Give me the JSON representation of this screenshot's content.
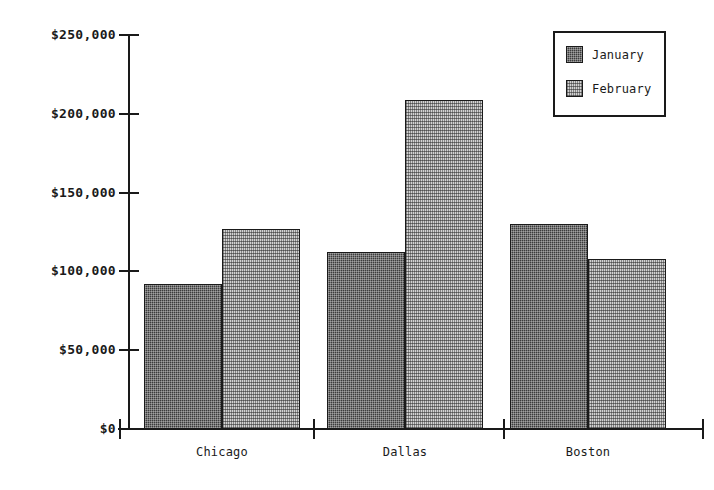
{
  "chart_data": {
    "type": "bar",
    "title": "",
    "xlabel": "",
    "ylabel": "",
    "categories": [
      "Chicago",
      "Dallas",
      "Boston"
    ],
    "series": [
      {
        "name": "January",
        "values": [
          92000,
          112000,
          130000
        ],
        "swatch_color": "#3c3c3c",
        "pattern": "dark-checker"
      },
      {
        "name": "February",
        "values": [
          127000,
          209000,
          108000
        ],
        "swatch_color": "#d2d2d2",
        "pattern": "light-dots"
      }
    ],
    "ylim": [
      0,
      250000
    ],
    "ytick_values": [
      250000,
      200000,
      150000,
      100000,
      50000,
      0
    ],
    "ytick_labels": [
      "$250,000",
      "$200,000",
      "$150,000",
      "$100,000",
      "$50,000",
      "$0"
    ],
    "grid": false,
    "legend_position": "top-right",
    "value_prefix": "$"
  },
  "legend": {
    "entries": [
      {
        "label": "January"
      },
      {
        "label": "February"
      }
    ]
  },
  "axes": {
    "y_tick_labels": [
      "$250,000",
      "$200,000",
      "$150,000",
      "$100,000",
      "$50,000",
      "$0"
    ],
    "x_tick_labels": [
      "Chicago",
      "Dallas",
      "Boston"
    ]
  }
}
